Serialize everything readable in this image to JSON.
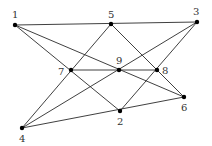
{
  "diagram": {
    "type": "configuration graph",
    "colors": {
      "edge": "#2a2a2a",
      "node": "#000000",
      "label": "#333333"
    },
    "nodes": [
      {
        "id": "1",
        "x": 15,
        "y": 25,
        "label": "1",
        "lx": 12,
        "ly": 18
      },
      {
        "id": "2",
        "x": 120,
        "y": 111,
        "label": "2",
        "lx": 117,
        "ly": 125
      },
      {
        "id": "3",
        "x": 197,
        "y": 22,
        "label": "3",
        "lx": 193,
        "ly": 15
      },
      {
        "id": "4",
        "x": 22,
        "y": 128,
        "label": "4",
        "lx": 19,
        "ly": 142
      },
      {
        "id": "5",
        "x": 111,
        "y": 24,
        "label": "5",
        "lx": 108,
        "ly": 18
      },
      {
        "id": "6",
        "x": 184,
        "y": 97,
        "label": "6",
        "lx": 181,
        "ly": 111
      },
      {
        "id": "7",
        "x": 71,
        "y": 70,
        "label": "7",
        "lx": 58,
        "ly": 75
      },
      {
        "id": "8",
        "x": 157,
        "y": 70,
        "label": "8",
        "lx": 162,
        "ly": 74
      },
      {
        "id": "9",
        "x": 119,
        "y": 70,
        "label": "9",
        "lx": 116,
        "ly": 64
      }
    ],
    "lines": [
      [
        "1",
        "5",
        "3"
      ],
      [
        "1",
        "9",
        "6"
      ],
      [
        "1",
        "7",
        "2"
      ],
      [
        "5",
        "7",
        "4"
      ],
      [
        "5",
        "8",
        "6"
      ],
      [
        "3",
        "9",
        "4"
      ],
      [
        "3",
        "8",
        "2"
      ],
      [
        "7",
        "9",
        "8"
      ],
      [
        "4",
        "2",
        "6"
      ]
    ]
  }
}
